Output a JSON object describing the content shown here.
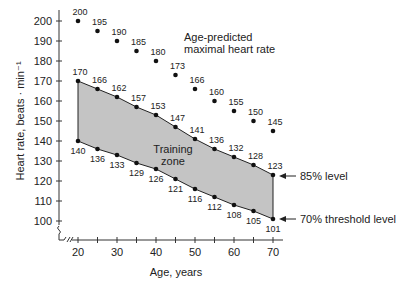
{
  "chart_data": {
    "type": "line",
    "title": "",
    "xlabel": "Age, years",
    "ylabel": "Heart rate, beats · min⁻¹",
    "x": [
      20,
      25,
      30,
      35,
      40,
      45,
      50,
      55,
      60,
      65,
      70
    ],
    "xticks": [
      20,
      30,
      40,
      50,
      60,
      70
    ],
    "yticks": [
      100,
      110,
      120,
      130,
      140,
      150,
      160,
      170,
      180,
      190,
      200
    ],
    "xlim": [
      20,
      70
    ],
    "ylim": [
      100,
      200
    ],
    "grid": false,
    "series": [
      {
        "name": "Age-predicted maximal heart rate",
        "values": [
          200,
          195,
          190,
          185,
          180,
          173,
          166,
          160,
          155,
          150,
          145
        ]
      },
      {
        "name": "85% level",
        "values": [
          170,
          166,
          162,
          157,
          153,
          147,
          141,
          136,
          132,
          128,
          123
        ]
      },
      {
        "name": "70% threshold level",
        "values": [
          140,
          136,
          133,
          129,
          126,
          121,
          116,
          112,
          108,
          105,
          101
        ]
      }
    ],
    "annotations": [
      {
        "text": "Age-predicted maximal heart rate",
        "lines": [
          "Age-predicted",
          "maximal heart rate"
        ]
      },
      {
        "text": "Training zone",
        "lines": [
          "Training",
          "zone"
        ]
      },
      {
        "text": "85% level"
      },
      {
        "text": "70% threshold level"
      }
    ],
    "shaded_region": {
      "between": [
        "85% level",
        "70% threshold level"
      ],
      "label": "Training zone",
      "color": "#c4c4c4"
    }
  },
  "labels": {
    "xlabel": "Age, years",
    "ylabel": "Heart rate, beats · min⁻¹",
    "max_label_1": "Age-predicted",
    "max_label_2": "maximal heart rate",
    "zone_label_1": "Training",
    "zone_label_2": "zone",
    "level85": "85% level",
    "level70": "70% threshold level"
  }
}
